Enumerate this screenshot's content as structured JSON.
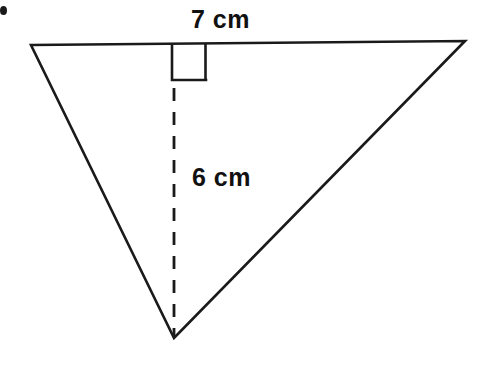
{
  "figure": {
    "background_color": "#ffffff",
    "stroke_color": "#1a1a1a",
    "text_color": "#111111",
    "width": 482,
    "height": 365,
    "labels": {
      "base": "7 cm",
      "height": "6 cm"
    },
    "shape": {
      "type": "triangle",
      "vertices": [
        {
          "name": "top-left",
          "x": 31,
          "y": 45
        },
        {
          "name": "top-right",
          "x": 465,
          "y": 41
        },
        {
          "name": "bottom-apex",
          "x": 174,
          "y": 338
        }
      ],
      "base_edge": {
        "from": "top-left",
        "to": "top-right"
      },
      "altitude": {
        "style": "dashed",
        "from_x": 174,
        "from_y": 45,
        "to_x": 174,
        "to_y": 338,
        "visible_from_y": 80
      },
      "right_angle_marker": {
        "x": 172,
        "y": 45,
        "size": 34,
        "side": "left-of-altitude"
      }
    },
    "artifact": {
      "name": "scan-speck",
      "x": 1,
      "y": 6,
      "width": 7,
      "height": 9
    }
  }
}
